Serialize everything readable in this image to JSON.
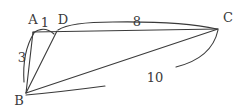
{
  "diagram": {
    "type": "geometry-figure",
    "stroke_color": "#3a3a3a",
    "points": {
      "A": {
        "label": "A",
        "x": 33,
        "y": 32
      },
      "D": {
        "label": "D",
        "x": 57,
        "y": 31
      },
      "C": {
        "label": "C",
        "x": 218,
        "y": 29
      },
      "B": {
        "label": "B",
        "x": 26,
        "y": 93
      }
    },
    "segments": [
      {
        "from": "A",
        "to": "C"
      },
      {
        "from": "A",
        "to": "B"
      },
      {
        "from": "D",
        "to": "B"
      },
      {
        "from": "C",
        "to": "B"
      }
    ],
    "measurements": {
      "AD": "1",
      "DC": "8",
      "AB": "3",
      "BC": "10"
    }
  }
}
